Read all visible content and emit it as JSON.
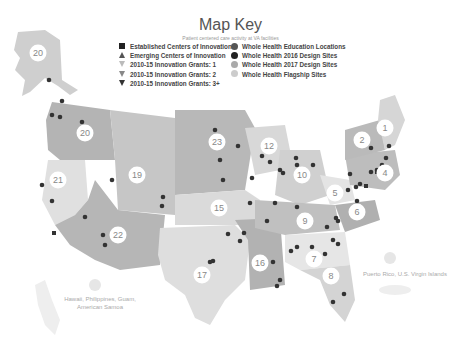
{
  "header": {
    "title": "Map Key",
    "subtitle": "Patient centered care activity at VA facilities"
  },
  "legend": {
    "left": [
      {
        "label": "Established Centers of Innovation",
        "symbol": "square",
        "color": "#222222"
      },
      {
        "label": "Emerging Centers of Innovation",
        "symbol": "triangle-up",
        "color": "#555555"
      },
      {
        "label": "2010-15 Innovation Grants: 1",
        "symbol": "triangle-down",
        "color": "#bbbbbb"
      },
      {
        "label": "2010-15 Innovation Grants: 2",
        "symbol": "triangle-down",
        "color": "#888888"
      },
      {
        "label": "2010-15 Innovation Grants: 3+",
        "symbol": "triangle-down",
        "color": "#333333"
      }
    ],
    "right": [
      {
        "label": "Whole Health Education Locations",
        "symbol": "circle",
        "color": "#555555"
      },
      {
        "label": "Whole Health 2016 Design Sites",
        "symbol": "circle",
        "color": "#222222"
      },
      {
        "label": "Whole Health 2017 Design Sites",
        "symbol": "circle",
        "color": "#aaaaaa"
      },
      {
        "label": "Whole Health Flagship Sites",
        "symbol": "circle",
        "color": "#cccccc"
      }
    ]
  },
  "regions": [
    {
      "id": "20",
      "x": 38,
      "y": 53
    },
    {
      "id": "20",
      "x": 85,
      "y": 133
    },
    {
      "id": "23",
      "x": 217,
      "y": 142
    },
    {
      "id": "12",
      "x": 269,
      "y": 146
    },
    {
      "id": "2",
      "x": 362,
      "y": 140
    },
    {
      "id": "1",
      "x": 385,
      "y": 128
    },
    {
      "id": "21",
      "x": 58,
      "y": 180
    },
    {
      "id": "19",
      "x": 137,
      "y": 175
    },
    {
      "id": "10",
      "x": 302,
      "y": 175
    },
    {
      "id": "4",
      "x": 385,
      "y": 173
    },
    {
      "id": "15",
      "x": 219,
      "y": 208
    },
    {
      "id": "5",
      "x": 335,
      "y": 193
    },
    {
      "id": "6",
      "x": 357,
      "y": 212
    },
    {
      "id": "9",
      "x": 305,
      "y": 221
    },
    {
      "id": "22",
      "x": 118,
      "y": 235
    },
    {
      "id": "7",
      "x": 314,
      "y": 259
    },
    {
      "id": "16",
      "x": 260,
      "y": 263
    },
    {
      "id": "8",
      "x": 331,
      "y": 276
    },
    {
      "id": "17",
      "x": 202,
      "y": 275
    }
  ],
  "notes": {
    "pacific": "Hawaii, Philippines, Guam, American Samoa",
    "caribbean": "Puerto Rico, U.S. Virgin Islands"
  },
  "colors": {
    "region_dark": "#b4b4b4",
    "region_mid": "#c8c8c8",
    "region_light": "#dcdcdc",
    "region_pale": "#e8e8e8",
    "marker": "#333333"
  }
}
